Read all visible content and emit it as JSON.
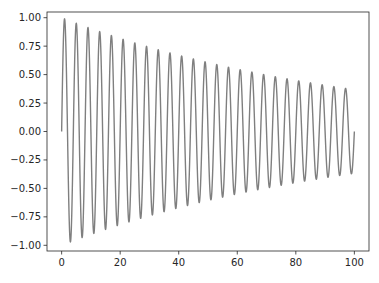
{
  "chart_data": {
    "type": "line",
    "title": "",
    "xlabel": "",
    "ylabel": "",
    "xlim": [
      -5,
      105
    ],
    "ylim": [
      -1.05,
      1.05
    ],
    "grid": false,
    "legend": null,
    "x_ticks": [
      0,
      20,
      40,
      60,
      80,
      100
    ],
    "x_tick_labels": [
      "0",
      "20",
      "40",
      "60",
      "80",
      "100"
    ],
    "y_ticks": [
      1.0,
      0.75,
      0.5,
      0.25,
      0.0,
      -0.25,
      -0.5,
      -0.75,
      -1.0
    ],
    "y_tick_labels": [
      "1.00",
      "0.75",
      "0.50",
      "0.25",
      "0.00",
      "−0.25",
      "−0.50",
      "−0.75",
      "−1.00"
    ],
    "series": [
      {
        "name": "damped sine",
        "color": "#7f7f7f",
        "function": "exp(-0.01*x) * sin(2*pi*x/4)",
        "x_range": [
          0,
          100
        ],
        "period": 4,
        "decay_rate": 0.01,
        "approx_peaks": [
          {
            "x": 1,
            "y": 0.99
          },
          {
            "x": 21,
            "y": 0.81
          },
          {
            "x": 41,
            "y": 0.66
          },
          {
            "x": 61,
            "y": 0.54
          },
          {
            "x": 81,
            "y": 0.44
          },
          {
            "x": 97,
            "y": 0.38
          }
        ],
        "approx_troughs": [
          {
            "x": 3,
            "y": -0.97
          },
          {
            "x": 23,
            "y": -0.79
          },
          {
            "x": 43,
            "y": -0.65
          },
          {
            "x": 63,
            "y": -0.53
          },
          {
            "x": 83,
            "y": -0.44
          },
          {
            "x": 99,
            "y": -0.37
          }
        ]
      }
    ]
  },
  "colors": {
    "line": "#7f7f7f",
    "axes": "#262626",
    "background": "#ffffff"
  }
}
